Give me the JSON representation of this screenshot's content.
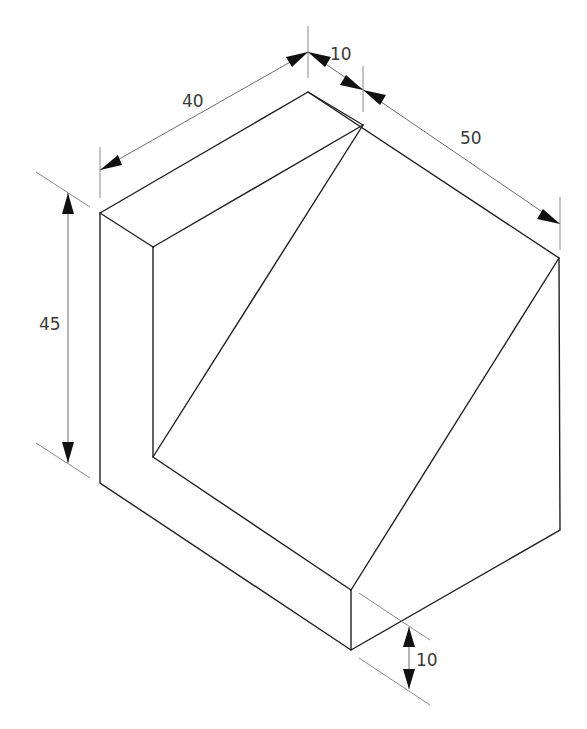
{
  "figure": {
    "type": "isometric-drawing",
    "dimensions": {
      "width_left": {
        "label": "40"
      },
      "width_notch": {
        "label": "10"
      },
      "depth_right": {
        "label": "50"
      },
      "height": {
        "label": "45"
      },
      "base_thickness": {
        "label": "10"
      }
    },
    "colors": {
      "edges": "#231f20",
      "extension_lines": "#8a8a8a",
      "arrows": "#111111",
      "text": "#3a3a3a"
    }
  }
}
